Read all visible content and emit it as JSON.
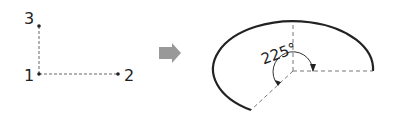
{
  "left_diagram": {
    "points": [
      {
        "label": "1"
      },
      {
        "label": "2"
      },
      {
        "label": "3"
      }
    ]
  },
  "arrow": {
    "icon": "right-arrow-icon",
    "color": "#999999"
  },
  "right_diagram": {
    "angle_label": "225°"
  },
  "colors": {
    "stroke": "#222222",
    "dashed": "#777777",
    "arrow": "#999999"
  }
}
